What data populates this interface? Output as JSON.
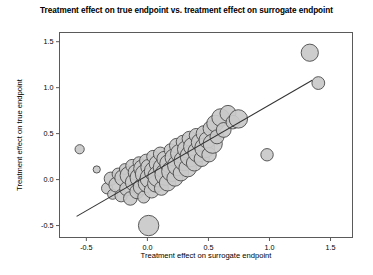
{
  "chart_data": {
    "type": "scatter",
    "title": "Treatment effect on true endpoint vs. treatment effect on surrogate endpoint",
    "xlabel": "Treatment effect on surrogate endpoint",
    "ylabel": "Treatment effect on true endpoint",
    "xlim": [
      -0.72,
      1.68
    ],
    "ylim": [
      -0.63,
      1.6
    ],
    "xticks": [
      -0.5,
      0.0,
      0.5,
      1.0,
      1.5
    ],
    "xtick_labels": [
      "-0.5",
      "0.0",
      "0.5",
      "1.0",
      "1.5"
    ],
    "yticks": [
      -0.5,
      0.0,
      0.5,
      1.0,
      1.5
    ],
    "ytick_labels": [
      "-0.5",
      "0.0",
      "0.5",
      "1.0",
      "1.5"
    ],
    "grid": false,
    "legend": null,
    "marker_shape": "circle",
    "marker_fill": "#c9c9c9",
    "marker_edge": "#4a4a4a",
    "bubble_size_encodes": "study weight",
    "regression_line": {
      "x_start": -0.58,
      "y_start": -0.4,
      "x_end": 1.35,
      "y_end": 1.08,
      "color": "#333333"
    },
    "points": [
      {
        "x": -0.555,
        "y": 0.33,
        "r": 4.6
      },
      {
        "x": -0.415,
        "y": 0.11,
        "r": 3.6
      },
      {
        "x": -0.33,
        "y": -0.095,
        "r": 5.6
      },
      {
        "x": -0.3,
        "y": 0.01,
        "r": 6.6
      },
      {
        "x": -0.285,
        "y": -0.16,
        "r": 5.0
      },
      {
        "x": -0.255,
        "y": -0.055,
        "r": 7.4
      },
      {
        "x": -0.24,
        "y": 0.06,
        "r": 6.0
      },
      {
        "x": -0.215,
        "y": -0.175,
        "r": 6.2
      },
      {
        "x": -0.2,
        "y": 0.02,
        "r": 8.2
      },
      {
        "x": -0.185,
        "y": 0.115,
        "r": 5.4
      },
      {
        "x": -0.17,
        "y": -0.1,
        "r": 7.0
      },
      {
        "x": -0.15,
        "y": 0.045,
        "r": 9.0
      },
      {
        "x": -0.14,
        "y": -0.205,
        "r": 6.8
      },
      {
        "x": -0.125,
        "y": 0.15,
        "r": 6.4
      },
      {
        "x": -0.11,
        "y": -0.03,
        "r": 8.6
      },
      {
        "x": -0.095,
        "y": 0.08,
        "r": 7.6
      },
      {
        "x": -0.085,
        "y": -0.13,
        "r": 7.2
      },
      {
        "x": -0.07,
        "y": 0.185,
        "r": 5.8
      },
      {
        "x": -0.06,
        "y": 0.02,
        "r": 10.0
      },
      {
        "x": -0.05,
        "y": -0.08,
        "r": 8.0
      },
      {
        "x": -0.04,
        "y": 0.12,
        "r": 8.8
      },
      {
        "x": -0.03,
        "y": -0.19,
        "r": 6.0
      },
      {
        "x": -0.02,
        "y": 0.06,
        "r": 9.6
      },
      {
        "x": -0.01,
        "y": 0.205,
        "r": 6.6
      },
      {
        "x": 0.0,
        "y": -0.04,
        "r": 9.2
      },
      {
        "x": 0.01,
        "y": 0.135,
        "r": 7.8
      },
      {
        "x": 0.01,
        "y": -0.5,
        "r": 10.2
      },
      {
        "x": 0.025,
        "y": 0.015,
        "r": 10.4
      },
      {
        "x": 0.035,
        "y": -0.12,
        "r": 7.4
      },
      {
        "x": 0.045,
        "y": 0.25,
        "r": 6.2
      },
      {
        "x": 0.055,
        "y": 0.09,
        "r": 9.8
      },
      {
        "x": 0.07,
        "y": -0.045,
        "r": 8.4
      },
      {
        "x": 0.08,
        "y": 0.175,
        "r": 8.0
      },
      {
        "x": 0.09,
        "y": 0.035,
        "r": 10.6
      },
      {
        "x": 0.105,
        "y": 0.28,
        "r": 6.8
      },
      {
        "x": 0.115,
        "y": -0.095,
        "r": 7.0
      },
      {
        "x": 0.125,
        "y": 0.13,
        "r": 9.4
      },
      {
        "x": 0.14,
        "y": 0.225,
        "r": 7.6
      },
      {
        "x": 0.15,
        "y": 0.055,
        "r": 10.8
      },
      {
        "x": 0.165,
        "y": -0.035,
        "r": 8.2
      },
      {
        "x": 0.175,
        "y": 0.175,
        "r": 9.0
      },
      {
        "x": 0.19,
        "y": 0.32,
        "r": 6.4
      },
      {
        "x": 0.2,
        "y": 0.09,
        "r": 10.2
      },
      {
        "x": 0.215,
        "y": 0.24,
        "r": 8.6
      },
      {
        "x": 0.225,
        "y": 0.015,
        "r": 8.0
      },
      {
        "x": 0.24,
        "y": 0.37,
        "r": 7.2
      },
      {
        "x": 0.25,
        "y": 0.155,
        "r": 10.4
      },
      {
        "x": 0.265,
        "y": 0.285,
        "r": 9.2
      },
      {
        "x": 0.275,
        "y": 0.07,
        "r": 7.8
      },
      {
        "x": 0.29,
        "y": 0.41,
        "r": 6.6
      },
      {
        "x": 0.3,
        "y": 0.205,
        "r": 10.0
      },
      {
        "x": 0.315,
        "y": 0.33,
        "r": 8.4
      },
      {
        "x": 0.33,
        "y": 0.125,
        "r": 8.8
      },
      {
        "x": 0.345,
        "y": 0.445,
        "r": 7.4
      },
      {
        "x": 0.355,
        "y": 0.255,
        "r": 10.6
      },
      {
        "x": 0.37,
        "y": 0.36,
        "r": 9.0
      },
      {
        "x": 0.385,
        "y": 0.18,
        "r": 8.0
      },
      {
        "x": 0.4,
        "y": 0.48,
        "r": 7.0
      },
      {
        "x": 0.415,
        "y": 0.3,
        "r": 10.2
      },
      {
        "x": 0.43,
        "y": 0.405,
        "r": 8.6
      },
      {
        "x": 0.445,
        "y": 0.225,
        "r": 7.6
      },
      {
        "x": 0.465,
        "y": 0.5,
        "r": 8.0
      },
      {
        "x": 0.47,
        "y": 0.345,
        "r": 10.0
      },
      {
        "x": 0.49,
        "y": 0.43,
        "r": 8.2
      },
      {
        "x": 0.505,
        "y": 0.27,
        "r": 7.2
      },
      {
        "x": 0.52,
        "y": 0.555,
        "r": 7.8
      },
      {
        "x": 0.535,
        "y": 0.39,
        "r": 9.6
      },
      {
        "x": 0.555,
        "y": 0.61,
        "r": 8.4
      },
      {
        "x": 0.57,
        "y": 0.465,
        "r": 7.0
      },
      {
        "x": 0.6,
        "y": 0.675,
        "r": 8.8
      },
      {
        "x": 0.625,
        "y": 0.54,
        "r": 7.4
      },
      {
        "x": 0.66,
        "y": 0.72,
        "r": 8.0
      },
      {
        "x": 0.7,
        "y": 0.625,
        "r": 6.8
      },
      {
        "x": 0.745,
        "y": 0.66,
        "r": 9.2
      },
      {
        "x": 0.98,
        "y": 0.27,
        "r": 6.2
      },
      {
        "x": 1.33,
        "y": 1.38,
        "r": 8.6
      },
      {
        "x": 1.4,
        "y": 1.05,
        "r": 6.4
      }
    ]
  }
}
